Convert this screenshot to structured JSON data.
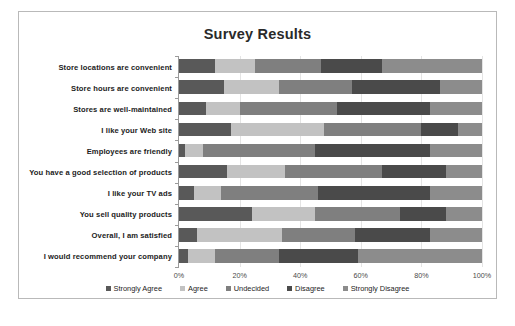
{
  "chart_data": {
    "type": "bar",
    "subtype": "100% stacked horizontal bar",
    "title": "Survey Results",
    "xlabel": "",
    "ylabel": "",
    "xlim": [
      0,
      100
    ],
    "grid": true,
    "legend_position": "bottom",
    "xticks": [
      "0%",
      "20%",
      "40%",
      "60%",
      "80%",
      "100%"
    ],
    "xtick_values": [
      0,
      20,
      40,
      60,
      80,
      100
    ],
    "categories": [
      "Store locations are convenient",
      "Store hours are convenient",
      "Stores are well-maintained",
      "I like your Web site",
      "Employees are friendly",
      "You have a good selection of products",
      "I like your TV ads",
      "You sell quality products",
      "Overall, I am satisfied",
      "I would recommend your company"
    ],
    "series": [
      {
        "name": "Strongly Agree",
        "color": "#595959",
        "values": [
          12,
          15,
          9,
          17,
          2,
          16,
          5,
          24,
          6,
          3
        ]
      },
      {
        "name": "Agree",
        "color": "#c2c2c2",
        "values": [
          13,
          18,
          11,
          31,
          6,
          19,
          9,
          21,
          28,
          9
        ]
      },
      {
        "name": "Undecided",
        "color": "#7f7f7f",
        "values": [
          22,
          24,
          32,
          32,
          37,
          32,
          32,
          28,
          24,
          21
        ]
      },
      {
        "name": "Disagree",
        "color": "#4a4a4a",
        "values": [
          20,
          29,
          31,
          12,
          38,
          21,
          37,
          15,
          25,
          26
        ]
      },
      {
        "name": "Strongly Disagree",
        "color": "#8c8c8c",
        "values": [
          33,
          14,
          17,
          8,
          17,
          12,
          17,
          12,
          17,
          41
        ]
      }
    ]
  },
  "legend": [
    {
      "label": "Strongly Agree",
      "color": "#595959"
    },
    {
      "label": "Agree",
      "color": "#c2c2c2"
    },
    {
      "label": "Undecided",
      "color": "#7f7f7f"
    },
    {
      "label": "Disagree",
      "color": "#4a4a4a"
    },
    {
      "label": "Strongly Disagree",
      "color": "#8c8c8c"
    }
  ],
  "style": {
    "border_color": "#b9b9b9",
    "gridline_color": "#e4e4e4",
    "axis_color": "#9a9a9a",
    "background": "#ffffff",
    "title_color": "#2a2a2a"
  }
}
